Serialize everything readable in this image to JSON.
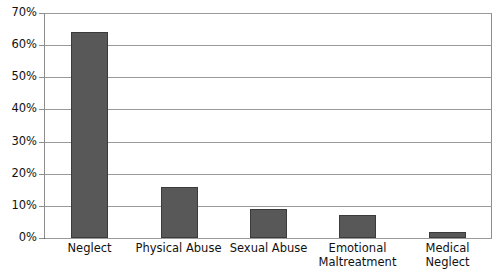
{
  "chart_data": {
    "type": "bar",
    "title": "",
    "subtitle": "",
    "xlabel": "",
    "ylabel": "",
    "categories": [
      "Neglect",
      "Physical Abuse",
      "Sexual Abuse",
      "Emotional\nMaltreatment",
      "Medical Neglect"
    ],
    "values": [
      64,
      16,
      9,
      7,
      2
    ],
    "ylim": [
      0,
      70
    ],
    "ytick_labels": [
      "70%",
      "60%",
      "50%",
      "40%",
      "30%",
      "20%",
      "10%",
      "0%"
    ],
    "ytick_values": [
      70,
      60,
      50,
      40,
      30,
      20,
      10,
      0
    ],
    "grid": true,
    "legend": false,
    "legend_position": "none",
    "bar_color": "#585858",
    "bar_edge_color": "#3b3b3b",
    "gridline_color": "#9a9a9a",
    "axis_color": "#8d8d8d",
    "background_color": "#ffffff"
  }
}
